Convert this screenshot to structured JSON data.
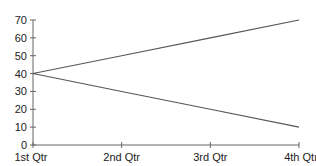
{
  "chart_data": {
    "type": "line",
    "title": "",
    "xlabel": "",
    "ylabel": "",
    "categories": [
      "1st Qtr",
      "2nd Qtr",
      "3rd Qtr",
      "4th Qtr"
    ],
    "series": [
      {
        "name": "Series 1",
        "values": [
          40,
          50,
          60,
          70
        ],
        "color": "#555555"
      },
      {
        "name": "Series 2",
        "values": [
          40,
          30,
          20,
          10
        ],
        "color": "#555555"
      }
    ],
    "ylim": [
      0,
      70
    ],
    "yticks": [
      0,
      10,
      20,
      30,
      40,
      50,
      60,
      70
    ],
    "grid": false,
    "legend": "none"
  }
}
